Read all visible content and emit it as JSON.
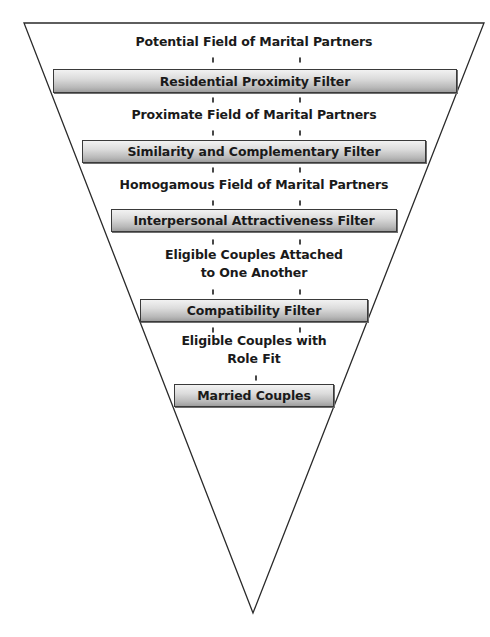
{
  "diagram": {
    "type": "funnel",
    "stages": [
      {
        "kind": "field",
        "lines": [
          "Potential Field of Marital Partners"
        ]
      },
      {
        "kind": "filter",
        "label": "Residential Proximity Filter"
      },
      {
        "kind": "field",
        "lines": [
          "Proximate Field of Marital Partners"
        ]
      },
      {
        "kind": "filter",
        "label": "Similarity and Complementary Filter"
      },
      {
        "kind": "field",
        "lines": [
          "Homogamous Field of Marital Partners"
        ]
      },
      {
        "kind": "filter",
        "label": "Interpersonal Attractiveness Filter"
      },
      {
        "kind": "field",
        "lines": [
          "Eligible Couples Attached",
          "to One Another"
        ]
      },
      {
        "kind": "filter",
        "label": "Compatibility Filter"
      },
      {
        "kind": "field",
        "lines": [
          "Eligible Couples with",
          "Role Fit"
        ]
      },
      {
        "kind": "result",
        "label": "Married Couples"
      }
    ]
  },
  "fields": {
    "potential": "Potential Field of Marital Partners",
    "proximate": "Proximate Field of Marital Partners",
    "homogamous": "Homogamous Field of Marital Partners",
    "attached_line1": "Eligible Couples Attached",
    "attached_line2": "to One Another",
    "role_fit_line1": "Eligible Couples with",
    "role_fit_line2": "Role Fit"
  },
  "filters": {
    "residential": "Residential Proximity Filter",
    "similarity": "Similarity and Complementary Filter",
    "attractiveness": "Interpersonal Attractiveness Filter",
    "compatibility": "Compatibility Filter",
    "married": "Married Couples"
  },
  "colors": {
    "outline": "#2a2a2a",
    "box_border": "#3a3a3a",
    "box_gradient_top": "#f2f2f2",
    "box_gradient_bottom": "#9e9e9e",
    "text": "#1a1a1a",
    "background": "#ffffff"
  }
}
